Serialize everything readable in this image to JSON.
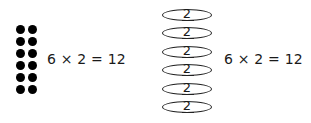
{
  "dot_array": {
    "rows": 6,
    "columns": 2,
    "equation": "6 × 2 = 12"
  },
  "group_stack": {
    "groups": [
      "2",
      "2",
      "2",
      "2",
      "2",
      "2"
    ],
    "equation": "6 × 2 = 12"
  },
  "colors": {
    "ink": "#000000",
    "background": "#ffffff"
  }
}
